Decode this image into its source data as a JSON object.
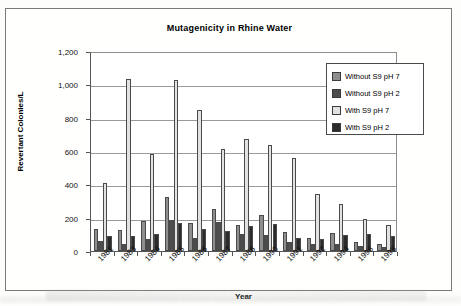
{
  "chart_data": {
    "type": "bar",
    "title": "Mutagenicity in Rhine Water",
    "xlabel": "Year",
    "ylabel": "Revertant Colonies/L",
    "ylim": [
      0,
      1200
    ],
    "yticks": [
      "0",
      "200",
      "400",
      "600",
      "800",
      "1,000",
      "1,200"
    ],
    "ytick_values": [
      0,
      200,
      400,
      600,
      800,
      1000,
      1200
    ],
    "grid": true,
    "legend_position": "top-right-inside",
    "categories": [
      "1981",
      "1983",
      "1984",
      "1985",
      "1986",
      "1987",
      "1988",
      "1990",
      "1991",
      "1992",
      "1994",
      "1996",
      "1998"
    ],
    "series": [
      {
        "name": "Without S9 pH 7",
        "color": "#8e8e8e",
        "values": [
          135,
          125,
          180,
          325,
          170,
          255,
          155,
          215,
          115,
          80,
          110,
          55,
          45
        ]
      },
      {
        "name": "Without S9 pH 2",
        "color": "#4d4d4d",
        "values": [
          60,
          45,
          75,
          185,
          80,
          175,
          100,
          95,
          55,
          40,
          45,
          30,
          25
        ]
      },
      {
        "name": "With S9 pH 7",
        "color": "#e2e2e2",
        "values": [
          410,
          1035,
          585,
          1025,
          845,
          615,
          670,
          635,
          560,
          340,
          280,
          190,
          155
        ]
      },
      {
        "name": "With S9 pH 2",
        "color": "#2b2b2b",
        "values": [
          90,
          90,
          100,
          170,
          130,
          120,
          150,
          160,
          80,
          70,
          95,
          105,
          90
        ]
      }
    ]
  }
}
